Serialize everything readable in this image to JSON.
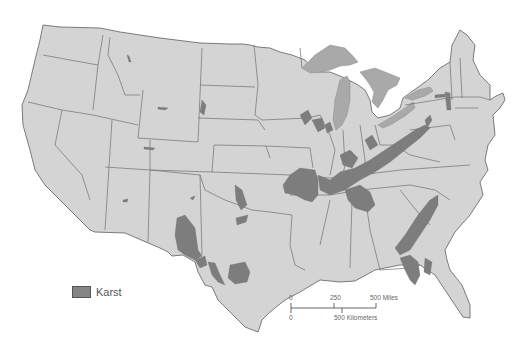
{
  "map": {
    "title": "Karst regions of the contiguous United States",
    "colors": {
      "land": "#d4d4d4",
      "border": "#6e6e6e",
      "lakes": "#a9a9a9",
      "karst": "#7d7d7d",
      "background": "#ffffff"
    },
    "legend": {
      "items": [
        {
          "label": "Karst",
          "color": "#858585"
        }
      ]
    },
    "scale_bar": {
      "miles": {
        "ticks": [
          "0",
          "250",
          "500 Miles"
        ]
      },
      "kilometers": {
        "ticks": [
          "0",
          "500 Kilometers"
        ]
      }
    }
  }
}
